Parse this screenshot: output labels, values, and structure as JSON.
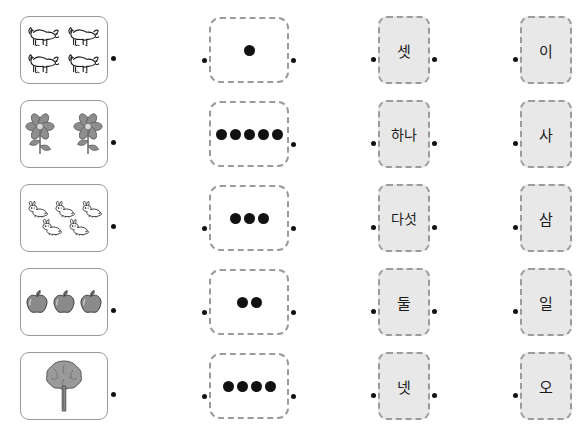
{
  "worksheet": {
    "title": "Korean number matching worksheet",
    "columns": [
      {
        "name": "picture-column",
        "kind": "picture"
      },
      {
        "name": "dots-column",
        "kind": "dots"
      },
      {
        "name": "native-korean-numeral-column",
        "kind": "word"
      },
      {
        "name": "sino-korean-numeral-column",
        "kind": "word"
      }
    ],
    "rows": [
      {
        "picture": {
          "icon": "dog-icon",
          "count": 4,
          "label": "four dogs"
        },
        "dots": {
          "count": 1
        },
        "native_word": "셋",
        "sino_word": "이",
        "connectors": {
          "picture_right": true,
          "dots_left": true,
          "dots_right": true,
          "native_left": true,
          "native_right": true,
          "sino_left": true,
          "sino_right": false
        }
      },
      {
        "picture": {
          "icon": "flower-icon",
          "count": 2,
          "label": "two flowers"
        },
        "dots": {
          "count": 5
        },
        "native_word": "하나",
        "sino_word": "사",
        "connectors": {
          "picture_right": true,
          "dots_left": false,
          "dots_right": true,
          "native_left": true,
          "native_right": true,
          "sino_left": true,
          "sino_right": false
        }
      },
      {
        "picture": {
          "icon": "rabbit-icon",
          "count": 5,
          "label": "five rabbits"
        },
        "dots": {
          "count": 3
        },
        "native_word": "다섯",
        "sino_word": "삼",
        "connectors": {
          "picture_right": true,
          "dots_left": true,
          "dots_right": true,
          "native_left": true,
          "native_right": true,
          "sino_left": true,
          "sino_right": false
        }
      },
      {
        "picture": {
          "icon": "apple-icon",
          "count": 3,
          "label": "three apples"
        },
        "dots": {
          "count": 2
        },
        "native_word": "둘",
        "sino_word": "일",
        "connectors": {
          "picture_right": true,
          "dots_left": true,
          "dots_right": true,
          "native_left": true,
          "native_right": true,
          "sino_left": true,
          "sino_right": false
        }
      },
      {
        "picture": {
          "icon": "tree-icon",
          "count": 1,
          "label": "one tree"
        },
        "dots": {
          "count": 4
        },
        "native_word": "넷",
        "sino_word": "오",
        "connectors": {
          "picture_right": true,
          "dots_left": true,
          "dots_right": true,
          "native_left": true,
          "native_right": true,
          "sino_left": true,
          "sino_right": false
        }
      }
    ],
    "colors": {
      "page_background": "#ffffff",
      "picture_box_border": "#9a9a9a",
      "dashed_border": "#9b9b9b",
      "word_box_fill": "#e8e8e8",
      "dot_fill": "#111111",
      "text": "#1a1a1a",
      "flower_gray": "#8e8e8e",
      "apple_gray": "#8a8a8a",
      "tree_gray": "#9a9a9a"
    }
  }
}
